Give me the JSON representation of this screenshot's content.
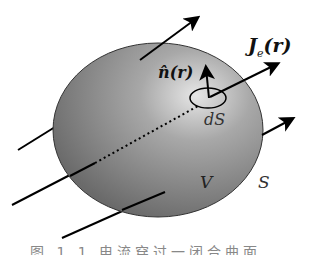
{
  "diagram": {
    "labels": {
      "current_density": "J",
      "current_density_sub": "e",
      "current_density_arg": "(r)",
      "normal": "n̂(r)",
      "surface_element": "dS",
      "volume": "V",
      "surface": "S"
    },
    "caption": "图 1.1  电流穿过一闭合曲面"
  }
}
